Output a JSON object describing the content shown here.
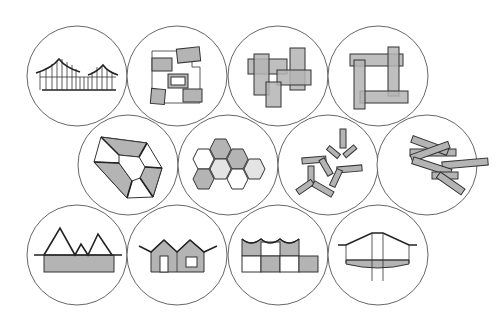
{
  "figure": {
    "colors": {
      "fill": "#b4b4b4",
      "light_fill": "#e4e4e4",
      "stroke": "#333333",
      "ring": "#555555",
      "background": "#ffffff"
    },
    "rows": [
      {
        "items": [
          {
            "id": "roofs-framework",
            "label": "twin curved roofs with timber frame"
          },
          {
            "id": "scattered-blocks",
            "label": "scattered blocks around courtyard"
          },
          {
            "id": "overlapping-rectangles",
            "label": "overlapping rectangles cluster"
          },
          {
            "id": "pinwheel-bars",
            "label": "pinwheel of interlocking bars"
          }
        ]
      },
      {
        "items": [
          {
            "id": "pentagon-ring",
            "label": "pentagonal ring with trapezoid wings"
          },
          {
            "id": "hexagon-cluster",
            "label": "honeycomb hexagon cluster"
          },
          {
            "id": "y-branches",
            "label": "scattered Y-shaped branching units"
          },
          {
            "id": "stacked-y",
            "label": "stacked Y-shaped bars"
          }
        ]
      },
      {
        "items": [
          {
            "id": "mountains-base",
            "label": "peaked mountain roofline over base"
          },
          {
            "id": "twin-houses",
            "label": "twin gabled houses"
          },
          {
            "id": "wave-grid",
            "label": "wave roof over checkerboard grid"
          },
          {
            "id": "bridge-section",
            "label": "bridge-like section on piers"
          }
        ]
      }
    ]
  }
}
